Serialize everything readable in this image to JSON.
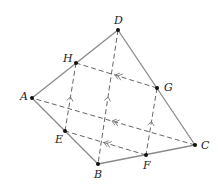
{
  "diagram": {
    "type": "quadrilateral-midpoint-parallelogram",
    "colors": {
      "solid_line": "#8a8a8a",
      "dashed_line": "#666666",
      "point": "#111111",
      "label": "#222222",
      "background": "#ffffff"
    },
    "points": {
      "A": {
        "x": 32,
        "y": 98,
        "label": "A"
      },
      "B": {
        "x": 98,
        "y": 164,
        "label": "B"
      },
      "C": {
        "x": 195,
        "y": 145,
        "label": "C"
      },
      "D": {
        "x": 118,
        "y": 30,
        "label": "D"
      },
      "E": {
        "x": 65,
        "y": 131,
        "label": "E"
      },
      "F": {
        "x": 146,
        "y": 155,
        "label": "F"
      },
      "G": {
        "x": 157,
        "y": 88,
        "label": "G"
      },
      "H": {
        "x": 76,
        "y": 63,
        "label": "H"
      }
    },
    "solid_edges": [
      [
        "A",
        "B"
      ],
      [
        "B",
        "C"
      ],
      [
        "C",
        "D"
      ],
      [
        "D",
        "A"
      ]
    ],
    "dashed_edges": [
      [
        "H",
        "E"
      ],
      [
        "D",
        "B"
      ],
      [
        "G",
        "F"
      ],
      [
        "G",
        "H"
      ],
      [
        "C",
        "A"
      ],
      [
        "F",
        "E"
      ]
    ],
    "markers": {
      "single_arrow_up": [
        [
          "E",
          "H"
        ],
        [
          "B",
          "D"
        ],
        [
          "F",
          "G"
        ]
      ],
      "double_arrow_left": [
        [
          "G",
          "H"
        ],
        [
          "C",
          "A"
        ],
        [
          "F",
          "E"
        ]
      ]
    }
  }
}
